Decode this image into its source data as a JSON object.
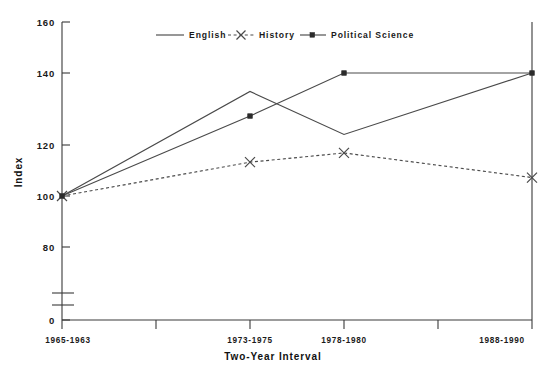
{
  "chart_data": {
    "type": "line",
    "title": "",
    "xlabel": "Two-Year Interval",
    "ylabel": "Index",
    "categories": [
      "1965-1963",
      "1973-1975",
      "1978-1980",
      "1988-1990"
    ],
    "x": [
      1,
      3,
      4,
      6
    ],
    "xtick_count": 6,
    "ylim": [
      0,
      160
    ],
    "yticks": [
      0,
      80,
      100,
      120,
      140,
      160
    ],
    "ytick_labels": [
      "0",
      "80",
      "100",
      "120",
      "140",
      "160"
    ],
    "y_axis_break": true,
    "y_axis_break_between": [
      0,
      80
    ],
    "grid": false,
    "legend_position": "top-center",
    "series": [
      {
        "name": "English",
        "style": "solid",
        "marker": "none",
        "color": "#4a4a4a",
        "values": [
          100,
          134,
          120,
          140
        ]
      },
      {
        "name": "History",
        "style": "dashed",
        "marker": "x",
        "color": "#4a4a4a",
        "values": [
          100,
          111,
          114,
          106
        ]
      },
      {
        "name": "Political Science",
        "style": "solid",
        "marker": "square",
        "color": "#4a4a4a",
        "values": [
          100,
          126,
          140,
          140
        ]
      }
    ]
  },
  "axes": {
    "y_label": "Index",
    "x_label": "Two-Year Interval",
    "y_ticks": [
      {
        "label": "160"
      },
      {
        "label": "140"
      },
      {
        "label": "120"
      },
      {
        "label": "100"
      },
      {
        "label": "80"
      },
      {
        "label": "0"
      }
    ],
    "x_ticks": [
      {
        "label": "1965-1963"
      },
      {
        "label": "1973-1975"
      },
      {
        "label": "1978-1980"
      },
      {
        "label": "1988-1990"
      }
    ]
  },
  "legend": {
    "items": [
      {
        "label": "English",
        "marker": "line-solid"
      },
      {
        "label": "History",
        "marker": "line-dashed-x"
      },
      {
        "label": "Political Science",
        "marker": "line-solid-square"
      }
    ]
  }
}
